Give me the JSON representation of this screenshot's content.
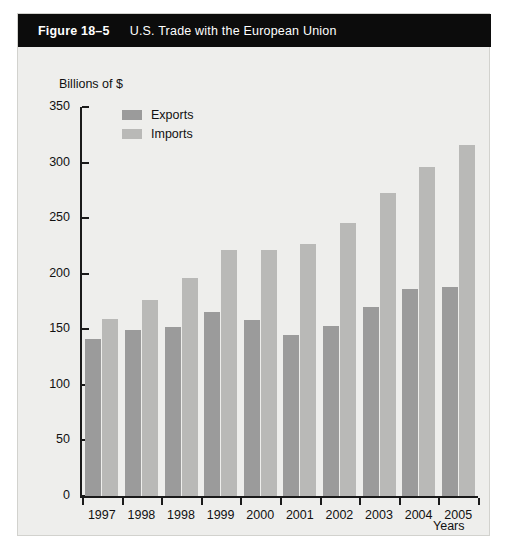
{
  "figure": {
    "number": "Figure 18–5",
    "title": "U.S. Trade with the European Union",
    "header_bg": "#0c0c0c",
    "header_text_color": "#ffffff",
    "panel_bg": "#eeeeec"
  },
  "chart_data": {
    "type": "bar",
    "title": "U.S. Trade with the European Union",
    "xlabel": "Years",
    "ylabel": "Billions of $",
    "categories": [
      "1997",
      "1998",
      "1998",
      "1999",
      "2000",
      "2001",
      "2002",
      "2003",
      "2004",
      "2005"
    ],
    "series": [
      {
        "name": "Exports",
        "color": "#9b9b9b",
        "values": [
          141,
          149,
          152,
          166,
          158,
          145,
          153,
          170,
          186,
          188
        ]
      },
      {
        "name": "Imports",
        "color": "#b9b9b7",
        "values": [
          159,
          176,
          196,
          221,
          221,
          227,
          246,
          273,
          296,
          316
        ]
      }
    ],
    "ylim": [
      0,
      350
    ],
    "yticks": [
      0,
      50,
      100,
      150,
      200,
      250,
      300,
      350
    ],
    "ytick_labels": [
      "0",
      "50",
      "100",
      "150",
      "200",
      "250",
      "300",
      "350"
    ],
    "grid": false,
    "legend_position": "upper-left-inside"
  }
}
